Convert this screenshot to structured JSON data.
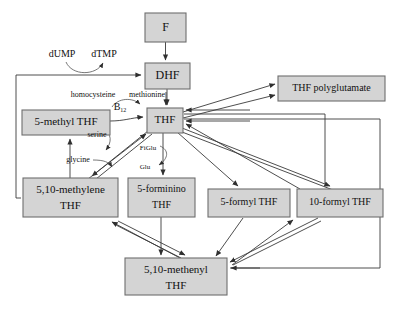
{
  "diagram": {
    "style": {
      "node_fill": "#d4d4d4",
      "node_stroke": "#6e6e6e",
      "arrow_color": "#3a3a3a",
      "background": "#ffffff",
      "text_color": "#111111"
    },
    "nodes": [
      {
        "id": "f",
        "label": "F",
        "label_line2": "",
        "x": 145,
        "y": 13,
        "w": 41,
        "h": 29,
        "font": 12
      },
      {
        "id": "dhf",
        "label": "DHF",
        "label_line2": "",
        "x": 145,
        "y": 63,
        "w": 45,
        "h": 26,
        "font": 12
      },
      {
        "id": "thf",
        "label": "THF",
        "label_line2": "",
        "x": 147,
        "y": 108,
        "w": 36,
        "h": 25,
        "font": 11
      },
      {
        "id": "thf_poly",
        "label": "THF polyglutamate",
        "label_line2": "",
        "x": 278,
        "y": 76,
        "w": 107,
        "h": 25,
        "font": 10
      },
      {
        "id": "methyl5",
        "label": "5-methyl THF",
        "label_line2": "",
        "x": 22,
        "y": 110,
        "w": 88,
        "h": 25,
        "font": 11
      },
      {
        "id": "methylene510",
        "label": "5,10-methylene",
        "label_line2": "THF",
        "x": 23,
        "y": 178,
        "w": 95,
        "h": 39,
        "font": 11
      },
      {
        "id": "forminino5",
        "label": "5-forminino",
        "label_line2": "THF",
        "x": 128,
        "y": 178,
        "w": 67,
        "h": 39,
        "font": 10
      },
      {
        "id": "formyl5",
        "label": "5-formyl THF",
        "label_line2": "",
        "x": 208,
        "y": 189,
        "w": 82,
        "h": 28,
        "font": 10
      },
      {
        "id": "formyl10",
        "label": "10-formyl THF",
        "label_line2": "",
        "x": 297,
        "y": 189,
        "w": 86,
        "h": 28,
        "font": 10
      },
      {
        "id": "methenyl510",
        "label": "5,10-methenyl",
        "label_line2": "THF",
        "x": 125,
        "y": 258,
        "w": 102,
        "h": 37,
        "font": 11
      }
    ],
    "annotations": [
      {
        "id": "dump",
        "text": "dUMP",
        "x": 62,
        "y": 55,
        "font": 10
      },
      {
        "id": "dtmp",
        "text": "dTMP",
        "x": 104,
        "y": 55,
        "font": 10
      },
      {
        "id": "homocysteine",
        "text": "homocysteine",
        "x": 93,
        "y": 95,
        "font": 8
      },
      {
        "id": "methionine",
        "text": "methionine",
        "x": 147,
        "y": 95,
        "font": 8
      },
      {
        "id": "b12",
        "text": "B",
        "sub": "12",
        "x": 122,
        "y": 108,
        "font": 10
      },
      {
        "id": "serine",
        "text": "serine",
        "x": 97,
        "y": 135,
        "font": 8
      },
      {
        "id": "glycine",
        "text": "glycine",
        "x": 78,
        "y": 160,
        "font": 8
      },
      {
        "id": "figlu",
        "text": "FiGlu",
        "x": 148,
        "y": 148,
        "font": 7
      },
      {
        "id": "glu",
        "text": "Glu",
        "x": 145,
        "y": 167,
        "font": 7
      }
    ]
  }
}
